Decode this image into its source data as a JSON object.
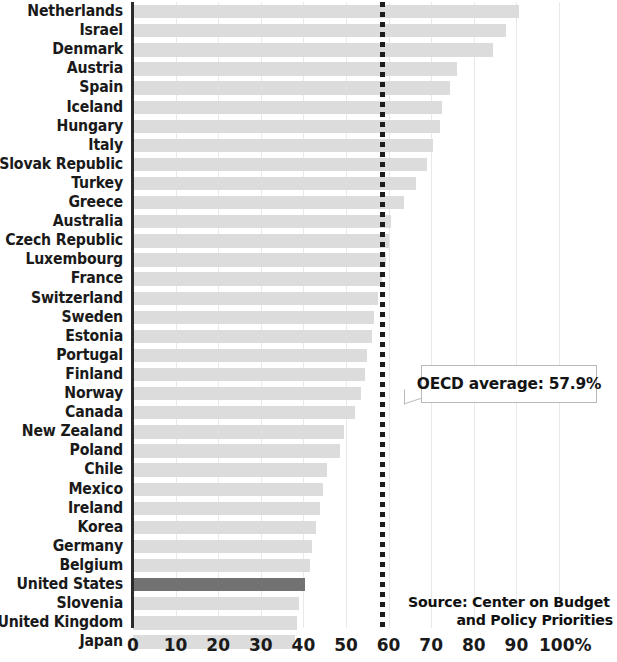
{
  "chart_data": {
    "type": "bar",
    "orientation": "horizontal",
    "title": "",
    "subtitle": "",
    "xlabel": "",
    "ylabel": "",
    "xlim": [
      0,
      100
    ],
    "unit": "%",
    "grid": true,
    "legend": null,
    "categories": [
      "Netherlands",
      "Israel",
      "Denmark",
      "Austria",
      "Spain",
      "Iceland",
      "Hungary",
      "Italy",
      "Slovak Republic",
      "Turkey",
      "Greece",
      "Australia",
      "Czech Republic",
      "Luxembourg",
      "France",
      "Switzerland",
      "Sweden",
      "Estonia",
      "Portugal",
      "Finland",
      "Norway",
      "Canada",
      "New Zealand",
      "Poland",
      "Chile",
      "Mexico",
      "Ireland",
      "Korea",
      "Germany",
      "Belgium",
      "United States",
      "Slovenia",
      "United Kingdom",
      "Japan"
    ],
    "values": [
      90.5,
      87.5,
      84.5,
      76.0,
      74.5,
      72.5,
      72.0,
      70.5,
      69.0,
      66.5,
      63.5,
      60.5,
      60.0,
      59.5,
      58.5,
      57.5,
      56.5,
      56.0,
      55.0,
      54.5,
      53.5,
      52.0,
      49.5,
      48.5,
      45.5,
      44.5,
      44.0,
      43.0,
      42.0,
      41.5,
      40.4,
      39.0,
      38.5,
      38.0
    ],
    "highlight_category": "United States",
    "highlight_color": "#727272",
    "bar_color": "#dcdcdc",
    "xticks": [
      0,
      10,
      20,
      30,
      40,
      50,
      60,
      70,
      80,
      90,
      100
    ],
    "xtick_labels": [
      "0",
      "10",
      "20",
      "30",
      "40",
      "50",
      "60",
      "70",
      "80",
      "90",
      "100%"
    ],
    "reference_line": {
      "value": 57.9,
      "style": "dotted",
      "color": "#1c1c1c",
      "label": "OECD average: 57.9%",
      "label_prefix": "OECD average: ",
      "label_value": "57.9%"
    },
    "annotations": [
      {
        "name": "source-note",
        "line1": "Source: Center on Budget",
        "line2": "and Policy Priorities"
      }
    ]
  }
}
